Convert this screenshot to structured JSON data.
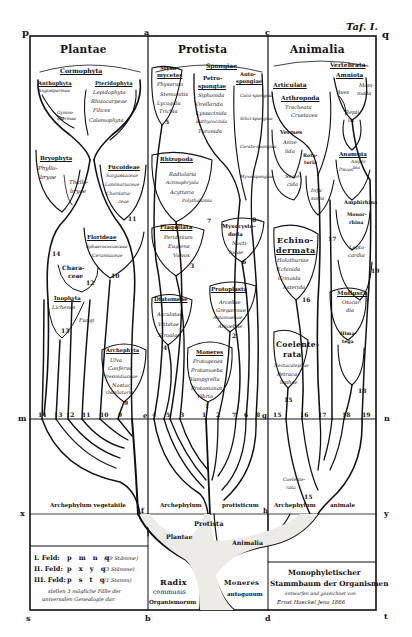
{
  "plate": {
    "plate_label": "Taf. I.",
    "corner_letters": {
      "p": "p",
      "a": "a",
      "c": "c",
      "q": "q",
      "m": "m",
      "n": "n",
      "x": "x",
      "y": "y",
      "s": "s",
      "b": "b",
      "d": "d",
      "t": "t",
      "e": "e",
      "f": "f",
      "g": "g",
      "h": "h"
    },
    "colors": {
      "paper": "#ffffff",
      "ink": "#111111",
      "trunk_fill": "#f2f2ee"
    }
  },
  "kingdoms": [
    {
      "name": "Plantae"
    },
    {
      "name": "Protista"
    },
    {
      "name": "Animalia"
    }
  ],
  "plantae": {
    "cormophyta": "Cormophyta",
    "anthophyta": {
      "name": "Anthophyta",
      "items": [
        "Angiospermae"
      ]
    },
    "gymnospermae": [
      "Gymno-",
      "spermae"
    ],
    "pteridophyta": {
      "name": "Pteridophyta",
      "items": [
        "Lepidophyta",
        "Rhizocarpeae",
        "Filices",
        "Calamophyta"
      ]
    },
    "bryophyta": {
      "name": "Bryophyta",
      "items": [
        "Phyllo-",
        "bryae"
      ]
    },
    "thallobryae": [
      "Thallo-",
      "bryae"
    ],
    "fucoideae": {
      "name": "Fucoideae",
      "items": [
        "Sargassaceae",
        "Laminariaceae",
        "Chordaria-",
        "ceae"
      ],
      "num": "11"
    },
    "florideae": {
      "name": "Florideae",
      "items": [
        "Sphaerococcaceae",
        "Ceramiaceae"
      ],
      "num": "10"
    },
    "characeae": {
      "name": [
        "Chara-",
        "ceae"
      ],
      "num": "12"
    },
    "inophyta": {
      "name": "Inophyta",
      "items": [
        "Lichenes",
        "Fungi"
      ],
      "num": "13"
    },
    "num14": "14",
    "archephyta": {
      "name": "Archephyta",
      "items": [
        "Ulva",
        "Conferva",
        "Desmidiaceae",
        "Nostoc",
        "Oscillatoria"
      ],
      "num": "9"
    },
    "bottom_nums": [
      "14",
      "13",
      "12",
      "11",
      "10",
      "9"
    ]
  },
  "protista": {
    "myxomycetes": {
      "name": [
        "Myxo-",
        "mycetes"
      ],
      "items": [
        "Physarum",
        "Stemonitis",
        "Lycogala",
        "Trichia"
      ],
      "num": "5"
    },
    "spongiae": "Spongiae",
    "petrospongiae": {
      "name": [
        "Petro-",
        "spongiae"
      ],
      "items": [
        "Siphonida",
        "Orellarida",
        "Lyssacinida",
        "Bathycoccida",
        "Turonida"
      ]
    },
    "autospongiae": {
      "name": [
        "Auto-",
        "spongiae"
      ],
      "items": [
        "Calci-spongiae",
        "Silici-spongiae",
        "Cerato-spongiae",
        "Myxo-spongiae"
      ],
      "num": "8"
    },
    "rhizopoda": {
      "name": "Rhizopoda",
      "items": [
        "Radiolaria",
        "Actinophryida",
        "Acyttaria",
        "Polythalamia"
      ],
      "num": "7"
    },
    "flagellata": {
      "name": "Flagellata",
      "items": [
        "Peridinium",
        "Euglena",
        "Volvox"
      ],
      "num": "3"
    },
    "myxocystoda": {
      "name": [
        "Myxocysto-",
        "doda"
      ],
      "items": [
        "Nocti-",
        "lucae"
      ],
      "num": "6"
    },
    "diatomeae": {
      "name": "Diatomeae",
      "items": [
        "Arculatae",
        "Vittatae",
        "Stroalae"
      ],
      "num": "4"
    },
    "protoplasta": {
      "name": "Protoplasta",
      "items": [
        "Arcellae",
        "Gregarinae",
        "Autamoebae",
        "Amoebae"
      ],
      "num": "2"
    },
    "moneres": {
      "name": "Moneres",
      "items": [
        "Protogenes",
        "Protamoeba",
        "Vampyrella",
        "Protomonas",
        "Vibrio"
      ],
      "num": "1"
    },
    "bottom_nums": [
      "4",
      "5",
      "3",
      "1",
      "2",
      "7",
      "6",
      "8"
    ]
  },
  "animalia": {
    "vertebrata": "Vertebrata",
    "amniota": "Amniota",
    "aves": "Aves",
    "mammalia": [
      "Mam-",
      "malia"
    ],
    "reptilia": [
      "Repti-",
      "lia"
    ],
    "articulata": "Articulata",
    "arthropoda": {
      "name": "Arthropoda",
      "items": [
        "Tracheata",
        "Crustacea"
      ]
    },
    "vermes": {
      "name": "Vermes",
      "items": [
        "Anne-",
        "lida"
      ]
    },
    "rotatoria": [
      "Rota-",
      "toria"
    ],
    "scolecida": [
      "Scole-",
      "cida"
    ],
    "infusoria": [
      "Infu-",
      "soria"
    ],
    "anamnia": {
      "name": "Anamnia",
      "items": [
        "Amphi-",
        "bia",
        "Pisces"
      ]
    },
    "amphirhina": "Amphirhina",
    "monorrhina": [
      "Monor-",
      "rhina"
    ],
    "leptocardia": [
      "Lepto-",
      "cardia"
    ],
    "echinodermata": {
      "name": [
        "Echino-",
        "dermata"
      ],
      "items": [
        "Holothuriae",
        "Echinida",
        "Crinoida",
        "Asterida"
      ],
      "num": "16"
    },
    "mollusca": {
      "name": "Mollusca",
      "items": [
        "Otocar-",
        "dia"
      ]
    },
    "himatega": [
      "Hima-",
      "tega"
    ],
    "coelenterata": {
      "name": [
        "Coelente-",
        "rata"
      ],
      "items": [
        "Nectacalephae",
        "Petraca-",
        "lephae"
      ],
      "num": "15"
    },
    "num17": "17",
    "num18": "18",
    "num19": "19",
    "bottom_nums": [
      "15",
      "16",
      "17",
      "18",
      "19"
    ]
  },
  "lower": {
    "archephylum_vegetabile": "Archephylum vegetabile",
    "archephylum_protisticum": [
      "Archephylum",
      "protisticum"
    ],
    "archephylum_animale": [
      "Archephylum",
      "animale"
    ],
    "trunk_protista": "Protista",
    "trunk_plantae": "Plantae",
    "trunk_animalia": "Animalia",
    "radix": [
      "Radix",
      "communis",
      "Organismorum"
    ],
    "moneres_autogonum": [
      "Moneres",
      "autogonum"
    ],
    "coelenterata_small": [
      "Coelente-",
      "rata"
    ],
    "num15": "15"
  },
  "legend": {
    "rows": [
      {
        "field": "I. Feld:",
        "letters": "p m n q",
        "note": "(19 Stämme)"
      },
      {
        "field": "II. Feld:",
        "letters": "p x y q",
        "note": "(3 Stämme)"
      },
      {
        "field": "III. Feld:",
        "letters": "p s t q",
        "note": "(1 Stamm)"
      }
    ],
    "caption": [
      "stellen 3 mögliche Fälle der",
      "universalen Genealogie dar."
    ]
  },
  "title_box": {
    "title": [
      "Monophyletischer",
      "Stammbaum der Organismen"
    ],
    "byline": "entworfen und gezeichnet von",
    "author": "Ernst Haeckel  Jena 1866"
  }
}
